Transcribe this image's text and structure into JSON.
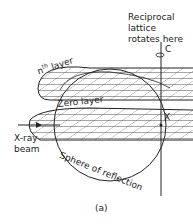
{
  "figure": {
    "caption": "(a)",
    "labels": {
      "reciprocal_line1": "Reciprocal",
      "reciprocal_line2": "lattice",
      "reciprocal_line3": "rotates here",
      "axis_point": "C",
      "nth_layer": "nth layer",
      "nth_layer_base": "n",
      "nth_layer_sup": "th",
      "nth_layer_word": " layer",
      "zero_layer": "Zero layer",
      "x_point": "X",
      "xray_line1": "X-ray",
      "xray_line2": "beam",
      "sphere": "Sphere of reflection"
    },
    "colors": {
      "ink": "#222222",
      "background": "#ffffff"
    }
  }
}
